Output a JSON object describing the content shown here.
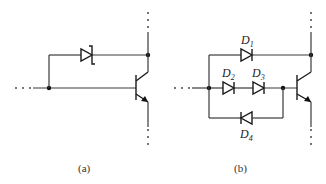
{
  "figure": {
    "panels": [
      {
        "id": "a",
        "caption": "(a)",
        "components": [
          {
            "type": "zener-diode",
            "label": ""
          },
          {
            "type": "npn-transistor",
            "label": ""
          }
        ]
      },
      {
        "id": "b",
        "caption": "(b)",
        "components": [
          {
            "type": "diode",
            "label": "D",
            "sub": "1"
          },
          {
            "type": "diode",
            "label": "D",
            "sub": "2"
          },
          {
            "type": "diode",
            "label": "D",
            "sub": "3"
          },
          {
            "type": "diode",
            "label": "D",
            "sub": "4"
          },
          {
            "type": "npn-transistor",
            "label": ""
          }
        ]
      }
    ],
    "continuation_marker": "· · ·",
    "colors": {
      "line": "#3a3a3a",
      "background": "#ffffff"
    }
  }
}
